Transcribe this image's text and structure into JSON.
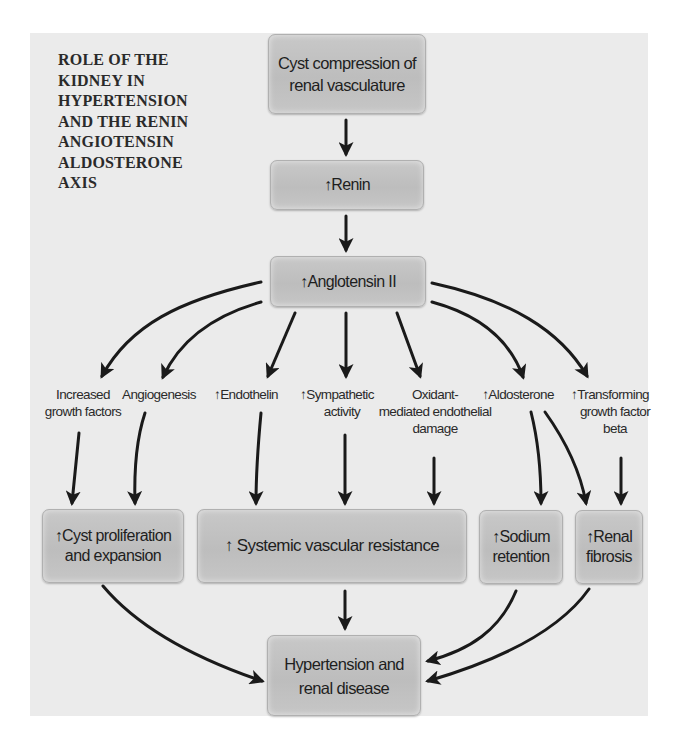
{
  "title": "ROLE OF THE KIDNEY IN HYPERTENSION AND THE RENIN ANGIOTENSIN ALDOSTERONE AXIS",
  "title_lines": [
    "ROLE OF THE",
    "KIDNEY IN",
    "HYPERTENSION",
    "AND THE RENIN",
    "ANGIOTENSIN",
    "ALDOSTERONE",
    "AXIS"
  ],
  "up_arrow_glyph": "↑",
  "boxes": {
    "cyst_compression": {
      "line1": "Cyst compression of",
      "line2": "renal vasculature"
    },
    "renin": {
      "prefix": "↑",
      "text": "Renin"
    },
    "angiotensin": {
      "prefix": "↑",
      "text": "Anglotensin II"
    },
    "cyst_proliferation": {
      "prefix": "↑",
      "line1": "Cyst proliferation",
      "line2": "and expansion"
    },
    "systemic_resistance": {
      "prefix": "↑",
      "text": " Systemic vascular resistance"
    },
    "sodium_retention": {
      "prefix": "↑",
      "line1": "Sodium",
      "line2": "retention"
    },
    "renal_fibrosis": {
      "prefix": "↑",
      "line1": "Renal",
      "line2": "fibrosis"
    },
    "hypertension": {
      "line1": "Hypertension and",
      "line2": "renal disease"
    }
  },
  "labels": {
    "growth_factors": {
      "line1": "Increased",
      "line2": "growth factors"
    },
    "angiogenesis": {
      "line1": "Angiogenesis"
    },
    "endothelin": {
      "prefix": "↑",
      "line1": "Endothelin"
    },
    "sympathetic": {
      "prefix": "↑",
      "line1": "Sympathetic",
      "line2": "activity"
    },
    "oxidant": {
      "line1": "Oxidant-",
      "line2": "mediated endothelial",
      "line3": "damage"
    },
    "aldosterone": {
      "prefix": "↑",
      "line1": "Aldosterone"
    },
    "tgf_beta": {
      "prefix": "↑",
      "line1": "Transforming",
      "line2": "growth factor",
      "line3": "beta"
    }
  },
  "colors": {
    "panel": "#ebebeb",
    "box": "#c2c2c2",
    "arrow": "#1a1a1a",
    "text": "#1e1e1e"
  }
}
